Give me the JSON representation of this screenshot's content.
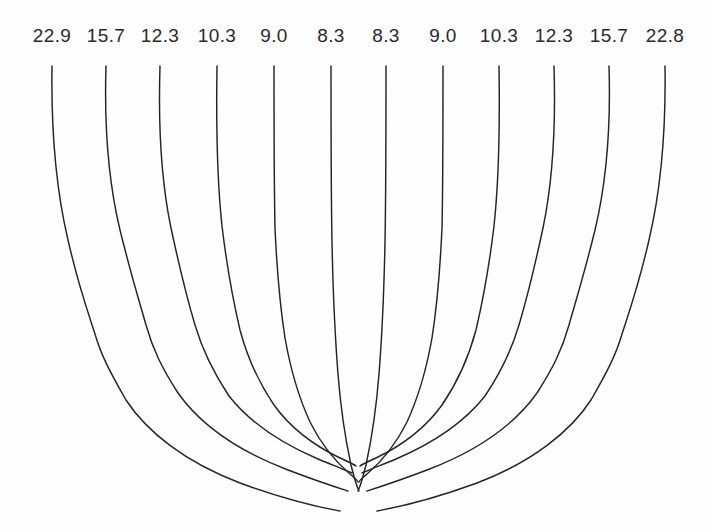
{
  "figure": {
    "background_color": "#fefefe",
    "line_color": "#242424",
    "label_color": "#2a2a2a",
    "width": 712,
    "height": 532
  },
  "labels": [
    {
      "text": "22.9",
      "x": 52
    },
    {
      "text": "15.7",
      "x": 106
    },
    {
      "text": "12.3",
      "x": 160
    },
    {
      "text": "10.3",
      "x": 217
    },
    {
      "text": "9.0",
      "x": 274
    },
    {
      "text": "8.3",
      "x": 331
    },
    {
      "text": "8.3",
      "x": 386
    },
    {
      "text": "9.0",
      "x": 443
    },
    {
      "text": "10.3",
      "x": 499
    },
    {
      "text": "12.3",
      "x": 554
    },
    {
      "text": "15.7",
      "x": 609
    },
    {
      "text": "22.8",
      "x": 665
    }
  ],
  "chart_data": {
    "type": "line",
    "title": "",
    "subtitle": "",
    "xlabel": "",
    "ylabel": "",
    "grid": false,
    "legend": "none",
    "annotations": [
      "Twelve streamlines labelled at the top edge with numeric values",
      "Curves descend vertically then sweep inward toward a convergence point near the bottom centre",
      "Labels are symmetric about the centre except the rightmost value 22.8 vs leftmost 22.9"
    ],
    "xlim": [
      0,
      712
    ],
    "ylim": [
      0,
      532
    ],
    "series": [
      {
        "name": "22.9",
        "label_value": 22.9,
        "top_x": 52,
        "path": "M52,66 C51,130 55,185 68,240 C79,288 88,312 95,334 C101,355 110,372 126,400 C147,432 185,462 240,483 C300,505 336,510 340,511"
      },
      {
        "name": "15.7",
        "label_value": 15.7,
        "top_x": 106,
        "path": "M106,66 C104,130 108,180 120,230 C131,275 139,300 146,325 C153,350 162,368 178,393 C200,424 238,451 288,470 C325,484 345,490 348,491"
      },
      {
        "name": "12.3",
        "label_value": 12.3,
        "top_x": 160,
        "path": "M160,66 C158,130 161,180 171,228 C180,270 187,298 195,325 C203,352 213,372 229,396 C251,424 283,444 318,459 C340,468 350,472 352,473"
      },
      {
        "name": "10.3",
        "label_value": 10.3,
        "top_x": 217,
        "path": "M217,66 C216,130 217,180 222,226 C227,268 233,300 240,330 C248,360 259,383 274,405 C292,430 317,447 340,458 C351,463 355,465 356,466"
      },
      {
        "name": "9.0",
        "label_value": 9.0,
        "top_x": 274,
        "path": "M274,66 C274,130 274,182 275,228 C277,272 280,306 285,338 C291,372 299,398 310,422 C322,446 337,463 350,474 C356,479 358,481 358,482"
      },
      {
        "name": "8.3",
        "label_value": 8.3,
        "top_x": 331,
        "path": "M331,66 C331,132 331,190 332,242 C333,292 335,336 338,374 C341,412 346,442 351,465 C355,481 358,489 359,491"
      },
      {
        "name": "8.3",
        "label_value": 8.3,
        "top_x": 386,
        "path": "M386,66 C386,132 386,190 385,242 C384,292 382,336 379,374 C376,412 371,442 366,465 C362,481 359,489 358,491"
      },
      {
        "name": "9.0",
        "label_value": 9.0,
        "top_x": 443,
        "path": "M443,66 C443,130 443,182 442,228 C440,272 437,306 432,338 C426,372 418,398 407,422 C395,446 380,463 367,474 C361,479 359,481 359,482"
      },
      {
        "name": "10.3",
        "label_value": 10.3,
        "top_x": 499,
        "path": "M499,66 C500,130 499,180 494,226 C489,268 483,300 476,330 C468,360 457,383 442,405 C424,430 399,447 376,458 C365,463 361,465 360,466"
      },
      {
        "name": "12.3",
        "label_value": 12.3,
        "top_x": 554,
        "path": "M554,66 C556,130 553,180 543,228 C534,270 527,298 519,325 C511,352 501,372 485,396 C463,424 431,444 396,459 C374,468 364,472 362,473"
      },
      {
        "name": "15.7",
        "label_value": 15.7,
        "top_x": 609,
        "path": "M609,66 C611,130 607,180 595,230 C584,275 576,300 569,325 C562,350 553,368 537,393 C515,424 477,451 427,470 C390,484 370,490 367,491"
      },
      {
        "name": "22.8",
        "label_value": 22.8,
        "top_x": 665,
        "path": "M665,66 C666,130 662,185 649,240 C638,288 629,312 622,334 C616,355 607,372 591,400 C570,432 532,462 477,483 C417,505 381,510 377,511"
      }
    ]
  }
}
